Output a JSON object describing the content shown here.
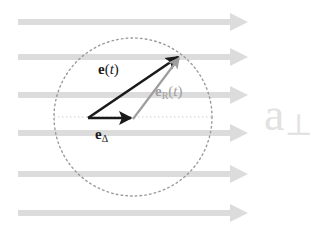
{
  "figure": {
    "width": 320,
    "height": 231,
    "background_color": "#ffffff"
  },
  "colors": {
    "field_arrow": "#dcdcdc",
    "circle_dotted": "#9a9a9a",
    "axis_dotted": "#c8c8c8",
    "vector_black": "#1a1a1a",
    "vector_gray": "#9e9e9e",
    "label_black": "#1a1a1a",
    "label_gray": "#a0a0a0",
    "big_symbol": "#e2e2e2"
  },
  "field_arrows": {
    "name": "transverse-field-lines",
    "count": 6,
    "x_start": 18,
    "x_tip": 248,
    "shaft_thickness": 6,
    "head_length": 18,
    "head_halfwidth": 9,
    "y_positions": [
      22,
      57,
      95,
      133,
      174,
      213
    ]
  },
  "circle": {
    "name": "uncertainty-circle",
    "center_x": 133,
    "center_y": 117,
    "radius": 79,
    "style": "dotted"
  },
  "axis": {
    "name": "horizontal-axis",
    "x1": 54,
    "x2": 212,
    "y": 117,
    "style": "dotted"
  },
  "vectors": [
    {
      "name": "vector-e-of-t",
      "label_html": "e(t)",
      "color": "#1a1a1a",
      "x1": 88,
      "y1": 118,
      "x2": 178,
      "y2": 57,
      "thickness": 2.6,
      "label_x": 98,
      "label_y": 62
    },
    {
      "name": "vector-e-delta",
      "label_html": "eΔ",
      "color": "#1a1a1a",
      "x1": 88,
      "y1": 118,
      "x2": 131,
      "y2": 118,
      "thickness": 2.6,
      "label_x": 95,
      "label_y": 128
    },
    {
      "name": "vector-e-r-of-t",
      "label_html": "eR(t)",
      "color": "#9e9e9e",
      "x1": 133,
      "y1": 119,
      "x2": 179,
      "y2": 58,
      "thickness": 2.2,
      "label_x": 156,
      "label_y": 84
    }
  ],
  "labels": {
    "e_of_t": {
      "name": "label-e-of-t",
      "base": "e",
      "arg_open": "(",
      "arg": "t",
      "arg_close": ")",
      "subscript": ""
    },
    "e_delta": {
      "name": "label-e-delta",
      "base": "e",
      "subscript": "Δ"
    },
    "e_r_of_t": {
      "name": "label-e-r-of-t",
      "base": "e",
      "subscript": "R",
      "arg_open": "(",
      "arg": "t",
      "arg_close": ")"
    },
    "a_perp": {
      "name": "label-a-perpendicular",
      "base": "a",
      "subscript": "⊥",
      "x": 264,
      "y": 92
    }
  }
}
